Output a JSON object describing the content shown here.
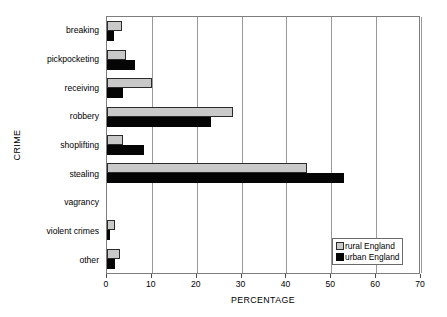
{
  "chart_data": {
    "type": "bar",
    "orientation": "horizontal",
    "title": "",
    "xlabel": "PERCENTAGE",
    "ylabel": "CRIME",
    "xlim": [
      0,
      70
    ],
    "xticks": [
      0,
      10,
      20,
      30,
      40,
      50,
      60,
      70
    ],
    "xtick_labels": [
      "0",
      "10",
      "20",
      "30",
      "40",
      "50",
      "60",
      "70"
    ],
    "grid": true,
    "legend_position": "bottom-right",
    "categories": [
      "breaking",
      "pickpocketing",
      "receiving",
      "robbery",
      "shoplifting",
      "stealing",
      "vagrancy",
      "violent crimes",
      "other"
    ],
    "series": [
      {
        "name": "rural England",
        "color": "#c9c9c9",
        "values": [
          3.3,
          4.3,
          10.0,
          28.2,
          3.6,
          44.5,
          0.0,
          1.8,
          2.8
        ]
      },
      {
        "name": "urban England",
        "color": "#050505",
        "values": [
          1.6,
          6.2,
          3.5,
          23.2,
          8.2,
          52.8,
          0.0,
          0.6,
          1.8
        ]
      }
    ]
  },
  "axes": {
    "y_title": "CRIME",
    "x_title": "PERCENTAGE"
  },
  "legend": {
    "entries": [
      {
        "label": "rural England",
        "swatch": "light-gray-square"
      },
      {
        "label": "urban England",
        "swatch": "black-square"
      }
    ]
  }
}
